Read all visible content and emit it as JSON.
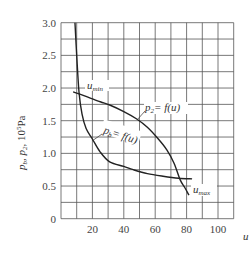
{
  "chart_data": {
    "type": "line",
    "title": "",
    "xlabel": "u",
    "ylabel": "p_b, p_2, 10^5 Pa",
    "xlim": [
      0,
      110
    ],
    "ylim": [
      0,
      3.0
    ],
    "x_ticks": [
      "20",
      "40",
      "60",
      "80",
      "100"
    ],
    "y_ticks": [
      "0",
      "0.5",
      "1.0",
      "1.5",
      "2.0",
      "2.5",
      "3.0"
    ],
    "grid": true,
    "grid_x_step": 10,
    "grid_y_step": 0.25,
    "series": [
      {
        "name": "p2 = f(u)",
        "x": [
          7.7,
          15,
          25,
          31,
          40,
          48,
          55,
          62,
          67.5,
          72,
          76,
          79,
          81.5
        ],
        "y": [
          1.94,
          1.88,
          1.79,
          1.74,
          1.64,
          1.53,
          1.4,
          1.22,
          1.05,
          0.85,
          0.59,
          0.47,
          0.36
        ]
      },
      {
        "name": "pb = f(u)",
        "x": [
          8.9,
          10,
          11.5,
          13.4,
          16,
          20,
          25,
          31,
          40,
          46,
          55,
          65,
          75,
          83.5
        ],
        "y": [
          3.0,
          2.5,
          1.93,
          1.6,
          1.38,
          1.22,
          1.02,
          0.87,
          0.8,
          0.75,
          0.69,
          0.65,
          0.62,
          0.61
        ]
      }
    ],
    "annotations": {
      "u_min": "u",
      "u_min_sub": "min",
      "u_max": "u",
      "u_max_sub": "max",
      "p2_label": "p",
      "p2_sub": "2",
      "p2_rest": "= f(u)",
      "pb_label": "p",
      "pb_sub": "b",
      "pb_rest": "= f(u)",
      "ylabel_main": "p",
      "ylabel_sub1": "b",
      "ylabel_mid": ", p",
      "ylabel_sub2": "2",
      "ylabel_unit": ", 10",
      "ylabel_exp": "5",
      "ylabel_pa": "Pa"
    }
  }
}
